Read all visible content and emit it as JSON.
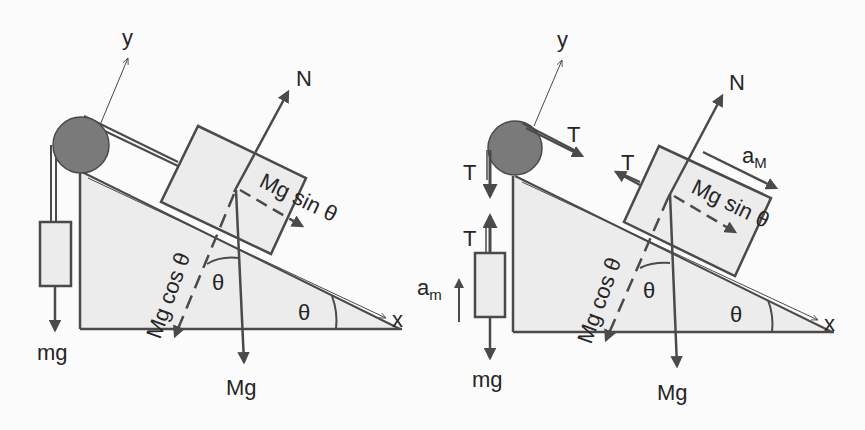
{
  "colors": {
    "background": "#fbfbfb",
    "stroke": "#4a4a4a",
    "fill_light": "#ececec",
    "pulley": "#7a7a7a",
    "text": "#262626"
  },
  "left_diagram": {
    "axis_y_label": "y",
    "axis_x_label": "x",
    "normal_label": "N",
    "weight_block_label": "Mg",
    "weight_hanging_label": "mg",
    "component_parallel_label": "Mg sin θ",
    "component_perp_label": "Mg cos θ",
    "angle_incline_label": "θ",
    "angle_block_label": "θ"
  },
  "right_diagram": {
    "axis_y_label": "y",
    "axis_x_label": "x",
    "normal_label": "N",
    "weight_block_label": "Mg",
    "weight_hanging_label": "mg",
    "component_parallel_label": "Mg sin θ",
    "component_perp_label": "Mg cos θ",
    "angle_incline_label": "θ",
    "angle_block_label": "θ",
    "tension_pulley_top_label": "T",
    "tension_pulley_side_label": "T",
    "tension_hanging_label": "T",
    "tension_block_label": "T",
    "accel_block_label": "a",
    "accel_block_subscript": "M",
    "accel_hanging_label": "a",
    "accel_hanging_subscript": "m"
  }
}
